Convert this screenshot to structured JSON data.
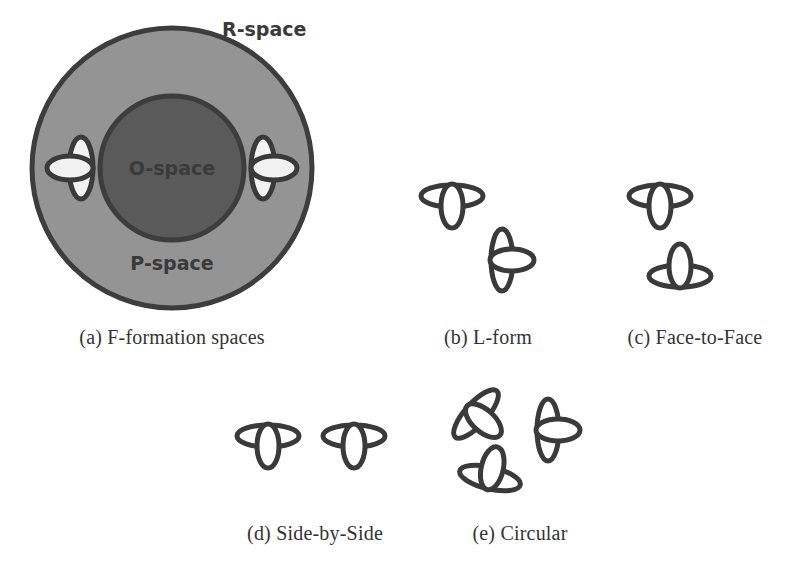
{
  "figure": {
    "background_color": "#ffffff",
    "ink_color": "#3a3a3a"
  },
  "colors": {
    "r_space_fill": "#949494",
    "o_space_fill": "#5a5a5a",
    "outline": "#3d3d3d",
    "person_stroke": "#3a3a3a",
    "person_fill": "#ffffff",
    "person_fill_in_gray": "#f2f2f2",
    "caption_text": "#333333"
  },
  "panels": [
    {
      "key": "a",
      "caption": "(a) F-formation spaces",
      "labels": {
        "outer": "R-space",
        "middle": "P-space",
        "inner": "O-space"
      },
      "people": [
        {
          "name": "person-left",
          "facing": "right"
        },
        {
          "name": "person-right",
          "facing": "left"
        }
      ]
    },
    {
      "key": "b",
      "caption": "(b) L-form",
      "people": [
        {
          "name": "person-top",
          "facing": "down"
        },
        {
          "name": "person-bottom",
          "facing": "left"
        }
      ]
    },
    {
      "key": "c",
      "caption": "(c) Face-to-Face",
      "people": [
        {
          "name": "person-top",
          "facing": "down"
        },
        {
          "name": "person-bottom",
          "facing": "up"
        }
      ]
    },
    {
      "key": "d",
      "caption": "(d) Side-by-Side",
      "people": [
        {
          "name": "person-left",
          "facing": "down"
        },
        {
          "name": "person-right",
          "facing": "down"
        }
      ]
    },
    {
      "key": "e",
      "caption": "(e) Circular",
      "people": [
        {
          "name": "person-upper-left",
          "facing": "down-right"
        },
        {
          "name": "person-right",
          "facing": "left"
        },
        {
          "name": "person-lower-left",
          "facing": "up-right"
        }
      ]
    }
  ]
}
